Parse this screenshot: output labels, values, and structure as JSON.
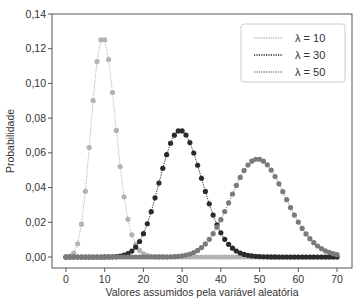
{
  "chart_data": {
    "type": "line",
    "title": "",
    "xlabel": "Valores assumidos pela variável aleatória",
    "ylabel": "Probabilidade",
    "xlim": [
      -3,
      74
    ],
    "ylim": [
      0,
      0.14
    ],
    "x_ticks": [
      0,
      10,
      20,
      30,
      40,
      50,
      60,
      70
    ],
    "x_tick_labels": [
      "0",
      "10",
      "20",
      "30",
      "40",
      "50",
      "60",
      "70"
    ],
    "y_ticks": [
      0.0,
      0.02,
      0.04,
      0.06,
      0.08,
      0.1,
      0.12,
      0.14
    ],
    "y_tick_labels": [
      "0,00",
      "0,02",
      "0,04",
      "0,06",
      "0,08",
      "0,10",
      "0,12",
      "0,14"
    ],
    "grid": false,
    "legend_position": "upper right",
    "distribution": "poisson",
    "x": [
      0,
      1,
      2,
      3,
      4,
      5,
      6,
      7,
      8,
      9,
      10,
      11,
      12,
      13,
      14,
      15,
      16,
      17,
      18,
      19,
      20,
      21,
      22,
      23,
      24,
      25,
      26,
      27,
      28,
      29,
      30,
      31,
      32,
      33,
      34,
      35,
      36,
      37,
      38,
      39,
      40,
      41,
      42,
      43,
      44,
      45,
      46,
      47,
      48,
      49,
      50,
      51,
      52,
      53,
      54,
      55,
      56,
      57,
      58,
      59,
      60,
      61,
      62,
      63,
      64,
      65,
      66,
      67,
      68,
      69,
      70
    ],
    "series": [
      {
        "name": "λ = 10",
        "lambda": 10,
        "color": "#b3b3b3",
        "peak_x": [
          9,
          10
        ],
        "peak_value": 0.1251
      },
      {
        "name": "λ = 30",
        "lambda": 30,
        "color": "#2b2b2b",
        "peak_x": [
          29,
          30
        ],
        "peak_value": 0.0726
      },
      {
        "name": "λ = 50",
        "lambda": 50,
        "color": "#7a7a7a",
        "peak_x": [
          49,
          50
        ],
        "peak_value": 0.0563
      }
    ]
  },
  "legend": {
    "items": [
      {
        "label": "λ = 10"
      },
      {
        "label": "λ = 30"
      },
      {
        "label": "λ = 50"
      }
    ]
  }
}
